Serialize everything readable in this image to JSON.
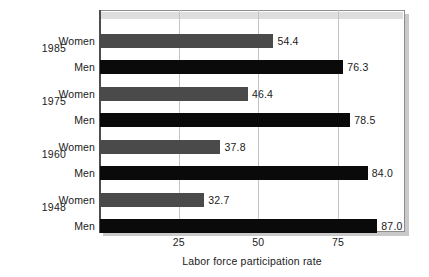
{
  "chart_data": {
    "type": "bar",
    "orientation": "horizontal",
    "title": "",
    "xlabel": "Labor force participation rate",
    "ylabel": "",
    "xlim": [
      0,
      96
    ],
    "xticks": [
      25,
      50,
      75
    ],
    "xtick_labels": [
      "25",
      "50",
      "75"
    ],
    "grid": true,
    "legend": "none",
    "categories": [
      "1985",
      "1975",
      "1960",
      "1948"
    ],
    "series": [
      {
        "name": "Women",
        "color": "#4a4a4a",
        "values": [
          54.4,
          46.4,
          37.8,
          32.7
        ],
        "value_labels": [
          "54.4",
          "46.4",
          "37.8",
          "32.7"
        ]
      },
      {
        "name": "Men",
        "color": "#0a0a0a",
        "values": [
          76.3,
          78.5,
          84.0,
          87.0
        ],
        "value_labels": [
          "76.3",
          "78.5",
          "84.0",
          "87.0"
        ]
      }
    ],
    "groups": [
      {
        "year": "1985",
        "rows": [
          {
            "label": "Women",
            "value": 54.4,
            "value_label": "54.4",
            "series": "Women"
          },
          {
            "label": "Men",
            "value": 76.3,
            "value_label": "76.3",
            "series": "Men"
          }
        ]
      },
      {
        "year": "1975",
        "rows": [
          {
            "label": "Women",
            "value": 46.4,
            "value_label": "46.4",
            "series": "Women"
          },
          {
            "label": "Men",
            "value": 78.5,
            "value_label": "78.5",
            "series": "Men"
          }
        ]
      },
      {
        "year": "1960",
        "rows": [
          {
            "label": "Women",
            "value": 37.8,
            "value_label": "37.8",
            "series": "Women"
          },
          {
            "label": "Men",
            "value": 84.0,
            "value_label": "84.0",
            "series": "Men"
          }
        ]
      },
      {
        "year": "1948",
        "rows": [
          {
            "label": "Women",
            "value": 32.7,
            "value_label": "32.7",
            "series": "Women"
          },
          {
            "label": "Men",
            "value": 87.0,
            "value_label": "87.0",
            "series": "Men"
          }
        ]
      }
    ]
  },
  "colors": {
    "women_bar": "#4a4a4a",
    "men_bar": "#0a0a0a",
    "gridline": "#c4c4c4",
    "frame": "#8d8d8d",
    "shadow": "#c9c9c9",
    "text": "#1a1a1a",
    "background": "#ffffff"
  }
}
